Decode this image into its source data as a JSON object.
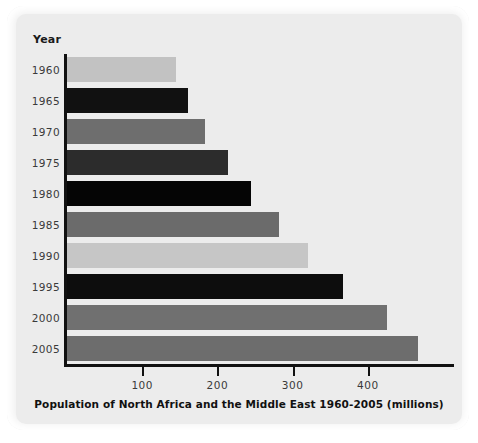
{
  "chart_data": {
    "type": "bar",
    "orientation": "horizontal",
    "title": "Population of North Africa and the Middle East 1960-2005 (millions)",
    "xlabel": "",
    "ylabel": "Year",
    "categories": [
      "1960",
      "1965",
      "1970",
      "1975",
      "1980",
      "1985",
      "1990",
      "1995",
      "2000",
      "2005"
    ],
    "values": [
      145,
      161,
      184,
      214,
      245,
      282,
      320,
      367,
      425,
      467
    ],
    "series": [
      {
        "name": "Population (millions)",
        "values": [
          145,
          161,
          184,
          214,
          245,
          282,
          320,
          367,
          425,
          467
        ]
      }
    ],
    "bar_colors": [
      "#c2c2c2",
      "#111111",
      "#6e6e6e",
      "#2c2c2c",
      "#050505",
      "#6b6b6b",
      "#c6c6c6",
      "#0d0d0d",
      "#707070",
      "#6d6d6d"
    ],
    "xlim": [
      0,
      520
    ],
    "xticks": [
      100,
      200,
      300,
      400
    ],
    "xtick_labels": [
      "100",
      "200",
      "300",
      "400"
    ],
    "grid": false,
    "legend": false
  },
  "axis": {
    "y_header": "Year",
    "tick_labels": [
      "100",
      "200",
      "300",
      "400"
    ]
  },
  "colors": {
    "panel_background": "#ececec",
    "page_background": "#ffffff",
    "axis": "#111111",
    "label_text": "#3a3a3a",
    "title_text": "#111111"
  }
}
